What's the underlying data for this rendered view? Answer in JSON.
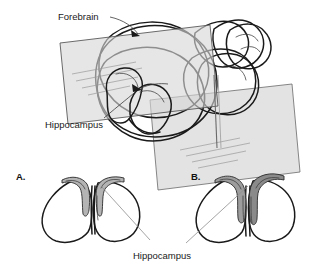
{
  "figure": {
    "background_color": "#ffffff",
    "outline_color": "#1a1a1a"
  },
  "top_panel": {
    "name": "three-dimensional-brain-with-coronal-plane",
    "labels": {
      "forebrain": "Forebrain",
      "hippocampus": "Hippocampus"
    },
    "plane": {
      "fill_color": "#d7d7d7",
      "edge_color": "#5a5a5a",
      "description": "translucent coronal cutting plane"
    },
    "structures": {
      "forebrain_fill": "#fbfbfb",
      "hippocampus_fill": "#f0f0f0",
      "cerebellum_fill": "#ffffff"
    }
  },
  "bottom_panel": {
    "name": "coronal-cross-sections",
    "shared_label": "Hippocampus",
    "sections": [
      {
        "letter": "A.",
        "name": "cross-section-a",
        "hippocampus_fill": "#b4b4b4",
        "hippocampus_size": "small"
      },
      {
        "letter": "B.",
        "name": "cross-section-b",
        "hippocampus_fill": "#8a8a8a",
        "hippocampus_size": "large"
      }
    ]
  },
  "colors": {
    "ink": "#1a1a1a",
    "leader_line": "#8d8d8d",
    "plane_gray": "#d7d7d7",
    "hippocampus_light": "#b4b4b4",
    "hippocampus_dark": "#8a8a8a"
  }
}
